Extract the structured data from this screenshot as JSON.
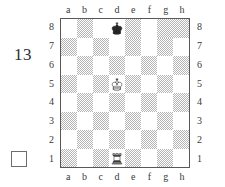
{
  "diagram": {
    "puzzle_number": "13",
    "side_to_move_marker": "white-empty-square",
    "board": {
      "files_top": [
        "a",
        "b",
        "c",
        "d",
        "e",
        "f",
        "g",
        "h"
      ],
      "files_bottom": [
        "a",
        "b",
        "c",
        "d",
        "e",
        "f",
        "g",
        "h"
      ],
      "ranks_left": [
        "8",
        "7",
        "6",
        "5",
        "4",
        "3",
        "2",
        "1"
      ],
      "ranks_right": [
        "8",
        "7",
        "6",
        "5",
        "4",
        "3",
        "2",
        "1"
      ],
      "light_square_color": "#ffffff",
      "dark_square_color": "#b4b4b4",
      "border_color": "#585858",
      "orientation": "white-bottom"
    },
    "pieces": [
      {
        "square": "d8",
        "color": "black",
        "type": "king",
        "glyph": "black-king-icon"
      },
      {
        "square": "d5",
        "color": "white",
        "type": "king",
        "glyph": "white-king-icon"
      },
      {
        "square": "d1",
        "color": "white",
        "type": "rook",
        "glyph": "white-rook-icon"
      }
    ],
    "squares": [
      [
        "light",
        "dark",
        "light",
        "light",
        "dark",
        "light",
        "dark",
        "dark"
      ],
      [
        "dark",
        "light",
        "dark",
        "light",
        "dark",
        "light",
        "dark",
        "light"
      ],
      [
        "light",
        "dark",
        "light",
        "dark",
        "light",
        "dark",
        "light",
        "dark"
      ],
      [
        "dark",
        "light",
        "dark",
        "light",
        "dark",
        "light",
        "dark",
        "light"
      ],
      [
        "light",
        "dark",
        "light",
        "dark",
        "light",
        "dark",
        "light",
        "dark"
      ],
      [
        "dark",
        "light",
        "dark",
        "light",
        "dark",
        "light",
        "dark",
        "light"
      ],
      [
        "light",
        "dark",
        "light",
        "dark",
        "light",
        "dark",
        "light",
        "dark"
      ],
      [
        "dark",
        "light",
        "dark",
        "light",
        "dark",
        "light",
        "dark",
        "light"
      ]
    ]
  }
}
